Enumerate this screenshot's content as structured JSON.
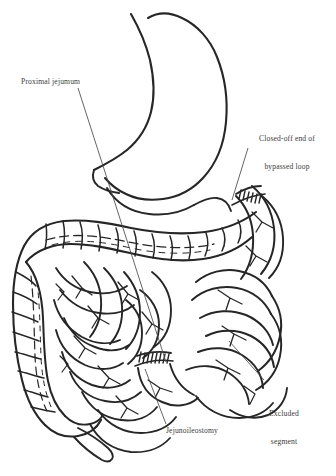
{
  "figure": {
    "kind": "medical-line-drawing",
    "title_semantic": "jejunoileal-bypass-anatomy",
    "ink_color": "#262626",
    "background_color": "#ffffff",
    "text_color": "#3a3a3a",
    "organs": [
      "stomach",
      "duodenum",
      "transverse-colon",
      "ascending-colon",
      "descending-colon",
      "cecum",
      "appendix",
      "small-bowel-loops",
      "bypassed-loop",
      "mesentery-vessels"
    ]
  },
  "labels": {
    "proximal_jejunum": "Proximal jejumum",
    "closed_off_line1": "Closed-off end of",
    "closed_off_line2": "bypassed loop",
    "excluded_line1": "Excluded",
    "excluded_line2": "segment",
    "jejunoileostomy": "Jejunoileostomy"
  }
}
